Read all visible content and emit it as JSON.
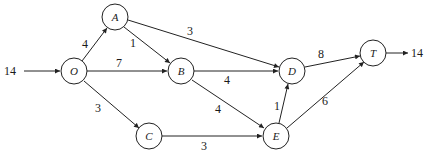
{
  "diagram": {
    "type": "network-flow",
    "source_supply": "14",
    "sink_demand": "14",
    "nodes": [
      {
        "id": "O",
        "label": "O",
        "x": 74,
        "y": 71
      },
      {
        "id": "A",
        "label": "A",
        "x": 115,
        "y": 17
      },
      {
        "id": "B",
        "label": "B",
        "x": 181,
        "y": 71
      },
      {
        "id": "C",
        "label": "C",
        "x": 149,
        "y": 136
      },
      {
        "id": "D",
        "label": "D",
        "x": 292,
        "y": 71
      },
      {
        "id": "E",
        "label": "E",
        "x": 276,
        "y": 136
      },
      {
        "id": "T",
        "label": "T",
        "x": 373,
        "y": 53
      }
    ],
    "edges": [
      {
        "from": "O",
        "to": "A",
        "label": "4"
      },
      {
        "from": "O",
        "to": "B",
        "label": "7"
      },
      {
        "from": "O",
        "to": "C",
        "label": "3"
      },
      {
        "from": "A",
        "to": "B",
        "label": "1"
      },
      {
        "from": "A",
        "to": "D",
        "label": "3"
      },
      {
        "from": "B",
        "to": "D",
        "label": "4"
      },
      {
        "from": "B",
        "to": "E",
        "label": "4"
      },
      {
        "from": "C",
        "to": "E",
        "label": "3"
      },
      {
        "from": "E",
        "to": "D",
        "label": "1"
      },
      {
        "from": "D",
        "to": "T",
        "label": "8"
      },
      {
        "from": "E",
        "to": "T",
        "label": "6"
      }
    ]
  }
}
